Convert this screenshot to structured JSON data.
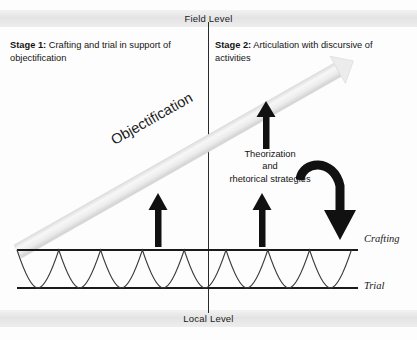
{
  "diagram": {
    "title_present": false,
    "levels": {
      "top": {
        "label": "Field Level",
        "name": "field-level"
      },
      "bottom": {
        "label": "Local Level",
        "name": "local-level"
      }
    },
    "stages": [
      {
        "key": "Stage 1:",
        "text": " Crafting and trial in support of objectification"
      },
      {
        "key": "Stage 2:",
        "text": " Articulation with discursive of activities"
      }
    ],
    "annotations": {
      "objectification": "Objectification",
      "theorization": "Theorization\nand\nrhetorical strategies",
      "theorization_line1": "Theorization",
      "theorization_line2": "and",
      "theorization_line3": "rhetorical strategies"
    },
    "process_lines": {
      "upper": "Crafting",
      "lower": "Trial"
    },
    "colors": {
      "band_fill": "#e9e9e9",
      "diagonal_arrow": "#e0e0e0",
      "stroke_dark": "#1a1a1a",
      "background": "#fdfdfd"
    },
    "wave": {
      "type": "sinusoid",
      "periods": 9,
      "upper_line_y": 250,
      "lower_line_y": 288,
      "x_start": 17,
      "x_end": 358
    }
  }
}
